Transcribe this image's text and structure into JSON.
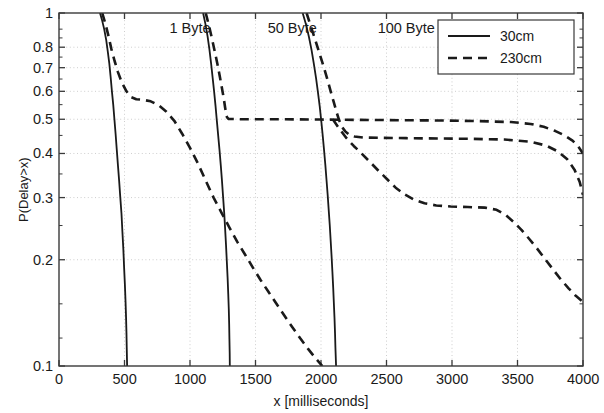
{
  "figure": {
    "background": "#ffffff",
    "ink": "#1a1a1a",
    "grid_color": "#c8c8c8",
    "plot_box": {
      "left": 59,
      "right": 583,
      "top": 13,
      "bottom": 366
    }
  },
  "axes": {
    "xlabel": "x [milliseconds]",
    "ylabel": "P(Delay>x)",
    "x_ticks": [
      "0",
      "500",
      "1000",
      "1500",
      "2000",
      "2500",
      "3000",
      "3500",
      "4000"
    ],
    "y_ticks": [
      "1",
      "0.8",
      "0.7",
      "0.6",
      "0.5",
      "0.4",
      "0.3",
      "0.2",
      "0.1"
    ]
  },
  "annotations": [
    {
      "text": "1 Byte",
      "x": 1000,
      "y": 0.905
    },
    {
      "text": "50 Byte",
      "x": 1780,
      "y": 0.905
    },
    {
      "text": "100 Byte",
      "x": 2650,
      "y": 0.905
    }
  ],
  "legend": {
    "entries": [
      {
        "label": "30cm",
        "style": "solid"
      },
      {
        "label": "230cm",
        "style": "dashed"
      }
    ],
    "position": "top-right"
  },
  "chart_data": {
    "type": "line",
    "title": "",
    "xlabel": "x [milliseconds]",
    "ylabel": "P(Delay>x)",
    "xlim": [
      0,
      4000
    ],
    "ylim": [
      0.1,
      1.0
    ],
    "yscale": "log",
    "xscale": "linear",
    "grid": true,
    "legend_position": "top-right",
    "group_labels": [
      "1 Byte",
      "50 Byte",
      "100 Byte"
    ],
    "series": [
      {
        "name": "1 Byte, 30cm",
        "group": "1 Byte",
        "distance": "30cm",
        "style": "solid",
        "points": [
          [
            313,
            1.0
          ],
          [
            330,
            0.95
          ],
          [
            345,
            0.9
          ],
          [
            360,
            0.84
          ],
          [
            372,
            0.78
          ],
          [
            384,
            0.72
          ],
          [
            394,
            0.66
          ],
          [
            404,
            0.6
          ],
          [
            414,
            0.55
          ],
          [
            423,
            0.5
          ],
          [
            432,
            0.455
          ],
          [
            441,
            0.41
          ],
          [
            450,
            0.37
          ],
          [
            459,
            0.335
          ],
          [
            468,
            0.3
          ],
          [
            477,
            0.27
          ],
          [
            484,
            0.24
          ],
          [
            491,
            0.215
          ],
          [
            497,
            0.19
          ],
          [
            503,
            0.17
          ],
          [
            508,
            0.152
          ],
          [
            512,
            0.137
          ],
          [
            515,
            0.124
          ],
          [
            517,
            0.113
          ],
          [
            519,
            0.104
          ],
          [
            520,
            0.1
          ]
        ]
      },
      {
        "name": "1 Byte, 230cm",
        "group": "1 Byte",
        "distance": "230cm",
        "style": "dashed",
        "points": [
          [
            330,
            1.0
          ],
          [
            355,
            0.93
          ],
          [
            378,
            0.86
          ],
          [
            400,
            0.79
          ],
          [
            425,
            0.73
          ],
          [
            450,
            0.68
          ],
          [
            480,
            0.635
          ],
          [
            515,
            0.6
          ],
          [
            550,
            0.578
          ],
          [
            590,
            0.57
          ],
          [
            640,
            0.568
          ],
          [
            700,
            0.562
          ],
          [
            760,
            0.548
          ],
          [
            820,
            0.525
          ],
          [
            880,
            0.495
          ],
          [
            940,
            0.455
          ],
          [
            1000,
            0.415
          ],
          [
            1060,
            0.375
          ],
          [
            1120,
            0.335
          ],
          [
            1180,
            0.3
          ],
          [
            1240,
            0.272
          ],
          [
            1300,
            0.247
          ],
          [
            1360,
            0.225
          ],
          [
            1420,
            0.207
          ],
          [
            1480,
            0.19
          ],
          [
            1540,
            0.175
          ],
          [
            1600,
            0.162
          ],
          [
            1660,
            0.15
          ],
          [
            1720,
            0.139
          ],
          [
            1780,
            0.129
          ],
          [
            1840,
            0.12
          ],
          [
            1900,
            0.112
          ],
          [
            1960,
            0.105
          ],
          [
            2010,
            0.1
          ]
        ]
      },
      {
        "name": "50 Byte, 30cm",
        "group": "50 Byte",
        "distance": "30cm",
        "style": "solid",
        "points": [
          [
            1100,
            1.0
          ],
          [
            1118,
            0.93
          ],
          [
            1134,
            0.86
          ],
          [
            1148,
            0.79
          ],
          [
            1161,
            0.72
          ],
          [
            1173,
            0.655
          ],
          [
            1184,
            0.6
          ],
          [
            1195,
            0.545
          ],
          [
            1205,
            0.495
          ],
          [
            1215,
            0.45
          ],
          [
            1225,
            0.41
          ],
          [
            1235,
            0.37
          ],
          [
            1244,
            0.335
          ],
          [
            1253,
            0.3
          ],
          [
            1261,
            0.272
          ],
          [
            1268,
            0.245
          ],
          [
            1275,
            0.22
          ],
          [
            1281,
            0.198
          ],
          [
            1287,
            0.178
          ],
          [
            1292,
            0.16
          ],
          [
            1296,
            0.145
          ],
          [
            1299,
            0.131
          ],
          [
            1301,
            0.119
          ],
          [
            1303,
            0.109
          ],
          [
            1304,
            0.1
          ]
        ]
      },
      {
        "name": "50 Byte, 230cm",
        "group": "50 Byte",
        "distance": "230cm",
        "style": "dashed",
        "points": [
          [
            1120,
            1.0
          ],
          [
            1145,
            0.92
          ],
          [
            1168,
            0.845
          ],
          [
            1190,
            0.775
          ],
          [
            1210,
            0.715
          ],
          [
            1228,
            0.66
          ],
          [
            1244,
            0.612
          ],
          [
            1258,
            0.572
          ],
          [
            1268,
            0.54
          ],
          [
            1276,
            0.518
          ],
          [
            1283,
            0.506
          ],
          [
            1295,
            0.501
          ],
          [
            1400,
            0.5
          ],
          [
            1700,
            0.5
          ],
          [
            2000,
            0.499
          ],
          [
            2300,
            0.498
          ],
          [
            2600,
            0.497
          ],
          [
            2900,
            0.496
          ],
          [
            3200,
            0.494
          ],
          [
            3450,
            0.491
          ],
          [
            3600,
            0.485
          ],
          [
            3700,
            0.476
          ],
          [
            3790,
            0.463
          ],
          [
            3860,
            0.45
          ],
          [
            3920,
            0.435
          ],
          [
            3965,
            0.418
          ],
          [
            4000,
            0.4
          ]
        ]
      },
      {
        "name": "100 Byte, 30cm",
        "group": "100 Byte",
        "distance": "30cm",
        "style": "solid",
        "points": [
          [
            1860,
            1.0
          ],
          [
            1885,
            0.93
          ],
          [
            1908,
            0.855
          ],
          [
            1928,
            0.785
          ],
          [
            1946,
            0.715
          ],
          [
            1962,
            0.655
          ],
          [
            1977,
            0.595
          ],
          [
            1990,
            0.545
          ],
          [
            2002,
            0.495
          ],
          [
            2013,
            0.45
          ],
          [
            2023,
            0.41
          ],
          [
            2033,
            0.372
          ],
          [
            2042,
            0.337
          ],
          [
            2051,
            0.305
          ],
          [
            2059,
            0.276
          ],
          [
            2067,
            0.25
          ],
          [
            2074,
            0.226
          ],
          [
            2081,
            0.204
          ],
          [
            2087,
            0.185
          ],
          [
            2093,
            0.167
          ],
          [
            2098,
            0.151
          ],
          [
            2103,
            0.137
          ],
          [
            2107,
            0.124
          ],
          [
            2110,
            0.113
          ],
          [
            2113,
            0.105
          ],
          [
            2115,
            0.1
          ]
        ]
      },
      {
        "name": "100 Byte, 230cm",
        "group": "100 Byte",
        "distance": "230cm",
        "style": "dashed",
        "points": [
          [
            1890,
            1.0
          ],
          [
            1925,
            0.91
          ],
          [
            1958,
            0.835
          ],
          [
            1990,
            0.765
          ],
          [
            2020,
            0.705
          ],
          [
            2048,
            0.65
          ],
          [
            2074,
            0.6
          ],
          [
            2098,
            0.558
          ],
          [
            2120,
            0.522
          ],
          [
            2140,
            0.495
          ],
          [
            2160,
            0.476
          ],
          [
            2185,
            0.462
          ],
          [
            2215,
            0.452
          ],
          [
            2255,
            0.447
          ],
          [
            2320,
            0.444
          ],
          [
            2450,
            0.443
          ],
          [
            2650,
            0.442
          ],
          [
            2900,
            0.441
          ],
          [
            3150,
            0.44
          ],
          [
            3400,
            0.438
          ],
          [
            3600,
            0.432
          ],
          [
            3720,
            0.421
          ],
          [
            3810,
            0.405
          ],
          [
            3880,
            0.385
          ],
          [
            3935,
            0.36
          ],
          [
            3975,
            0.332
          ],
          [
            4000,
            0.305
          ]
        ]
      },
      {
        "name": "100 Byte, 230cm (tail)",
        "group": "100 Byte",
        "distance": "230cm",
        "style": "dashed",
        "points": [
          [
            2090,
            0.5
          ],
          [
            2140,
            0.47
          ],
          [
            2195,
            0.442
          ],
          [
            2250,
            0.42
          ],
          [
            2310,
            0.4
          ],
          [
            2375,
            0.378
          ],
          [
            2440,
            0.357
          ],
          [
            2505,
            0.338
          ],
          [
            2570,
            0.32
          ],
          [
            2640,
            0.306
          ],
          [
            2710,
            0.296
          ],
          [
            2790,
            0.289
          ],
          [
            2880,
            0.285
          ],
          [
            2990,
            0.283
          ],
          [
            3120,
            0.282
          ],
          [
            3250,
            0.281
          ],
          [
            3340,
            0.277
          ],
          [
            3410,
            0.268
          ],
          [
            3470,
            0.256
          ],
          [
            3530,
            0.243
          ],
          [
            3590,
            0.229
          ],
          [
            3650,
            0.215
          ],
          [
            3710,
            0.201
          ],
          [
            3770,
            0.188
          ],
          [
            3830,
            0.176
          ],
          [
            3890,
            0.166
          ],
          [
            3945,
            0.158
          ],
          [
            4000,
            0.152
          ]
        ]
      }
    ]
  }
}
